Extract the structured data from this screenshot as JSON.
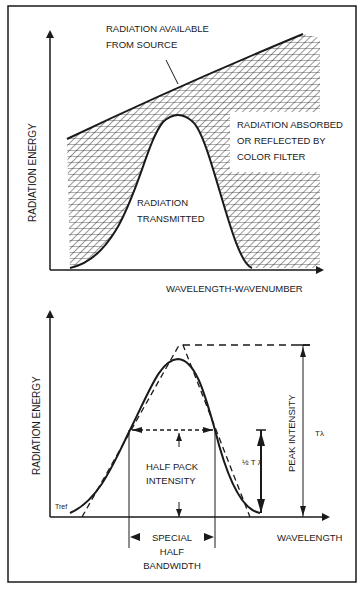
{
  "figure": {
    "frame_color": "#1a1a1a",
    "background": "#ffffff"
  },
  "top_chart": {
    "y_axis_label": "RADIATION ENERGY",
    "x_axis_label": "WAVELENGTH-WAVENUMBER",
    "labels": {
      "source_line1": "RADIATION AVAILABLE",
      "source_line2": "FROM SOURCE",
      "absorbed_line1": "RADIATION ABSORBED",
      "absorbed_line2": "OR REFLECTED BY",
      "absorbed_line3": "COLOR FILTER",
      "transmitted_line1": "RADIATION",
      "transmitted_line2": "TRANSMITTED"
    }
  },
  "bottom_chart": {
    "y_axis_label": "RADIATION ENERGY",
    "x_axis_label": "WAVELENGTH",
    "labels": {
      "t_ref": "Tref",
      "half_peak_line1": "HALF PACK",
      "half_peak_line2": "INTENSITY",
      "half_t": "½ T λ",
      "peak_intensity": "PEAK  INTENSITY",
      "t_lambda": "Tλ",
      "bandwidth_line1": "SPECIAL",
      "bandwidth_line2": "HALF",
      "bandwidth_line3": "BANDWIDTH"
    }
  }
}
